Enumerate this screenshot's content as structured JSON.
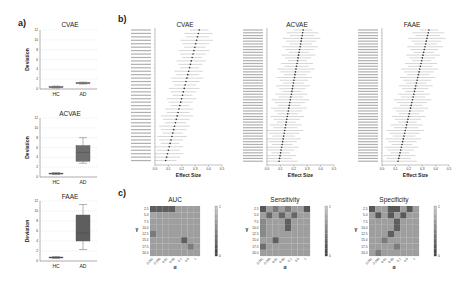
{
  "panels": {
    "a": "a)",
    "b": "b)",
    "c": "c)"
  },
  "chart_data": [
    {
      "id": "a-cvae",
      "type": "box",
      "title": "CVAE",
      "ylabel": "Deviation",
      "categories": [
        "HC",
        "AD"
      ],
      "ylim": [
        0,
        12
      ],
      "yticks": [
        0,
        2,
        4,
        6,
        8,
        10,
        12
      ],
      "boxes": [
        {
          "name": "HC",
          "min": 0.2,
          "q1": 0.3,
          "median": 0.4,
          "q3": 0.5,
          "max": 0.6
        },
        {
          "name": "AD",
          "min": 1.0,
          "q1": 1.1,
          "median": 1.2,
          "q3": 1.3,
          "max": 1.4
        }
      ],
      "grid": true,
      "color": "#7a7a7a"
    },
    {
      "id": "a-acvae",
      "type": "box",
      "title": "ACVAE",
      "ylabel": "Deviation",
      "categories": [
        "HC",
        "AD"
      ],
      "ylim": [
        0,
        12
      ],
      "yticks": [
        0,
        2,
        4,
        6,
        8,
        10,
        12
      ],
      "boxes": [
        {
          "name": "HC",
          "min": 0.5,
          "q1": 0.6,
          "median": 0.7,
          "q3": 0.8,
          "max": 0.9
        },
        {
          "name": "AD",
          "min": 2.8,
          "q1": 3.2,
          "median": 5.0,
          "q3": 6.4,
          "max": 8.0
        }
      ],
      "grid": true,
      "color": "#6e6e6e"
    },
    {
      "id": "a-faae",
      "type": "box",
      "title": "FAAE",
      "ylabel": "Deviation",
      "categories": [
        "HC",
        "AD"
      ],
      "ylim": [
        0,
        12
      ],
      "yticks": [
        0,
        2,
        4,
        6,
        8,
        10,
        12
      ],
      "boxes": [
        {
          "name": "HC",
          "min": 0.5,
          "q1": 0.6,
          "median": 0.7,
          "q3": 0.8,
          "max": 0.9
        },
        {
          "name": "AD",
          "min": 2.3,
          "q1": 4.0,
          "median": 5.6,
          "q3": 9.2,
          "max": 11.3
        }
      ],
      "grid": true,
      "color": "#5e5e5e"
    },
    {
      "id": "b-cvae",
      "type": "forest",
      "title": "CVAE",
      "xlabel": "Effect Size",
      "xlim": [
        0,
        0.5
      ],
      "xticks": [
        "0.0",
        "0.1",
        "0.2",
        "0.3",
        "0.4",
        "0.5"
      ],
      "n_rows": 39,
      "effect_range": [
        0.08,
        0.33
      ],
      "ci_halfwidth": [
        0.07,
        0.12
      ]
    },
    {
      "id": "b-acvae",
      "type": "forest",
      "title": "ACVAE",
      "xlabel": "Effect Size",
      "xlim": [
        0,
        0.5
      ],
      "xticks": [
        "0.0",
        "0.1",
        "0.2",
        "0.3",
        "0.4",
        "0.5"
      ],
      "n_rows": 48,
      "effect_range": [
        0.09,
        0.27
      ],
      "ci_halfwidth": [
        0.07,
        0.14
      ]
    },
    {
      "id": "b-faae",
      "type": "forest",
      "title": "FAAE",
      "xlabel": "Effect Size",
      "xlim": [
        0,
        0.5
      ],
      "xticks": [
        "0.0",
        "0.1",
        "0.2",
        "0.3",
        "0.4",
        "0.5"
      ],
      "n_rows": 48,
      "effect_range": [
        0.12,
        0.35
      ],
      "ci_halfwidth": [
        0.07,
        0.14
      ]
    },
    {
      "id": "c-auc",
      "type": "heatmap",
      "title": "AUC",
      "xlabel": "α",
      "ylabel": "γ",
      "yticks": [
        "2.5",
        "5.0",
        "7.5",
        "10.0",
        "12.5",
        "15.0",
        "17.5",
        "20.0"
      ],
      "xticks": [
        "0.001",
        "0.005",
        "0.01",
        "0.05",
        "0.1",
        "0.5",
        "1"
      ],
      "colorbar": {
        "min": 0,
        "max": 1
      },
      "values": [
        [
          0.25,
          0.25,
          0.25,
          0.25,
          0.7,
          0.7,
          0.7,
          0.7
        ],
        [
          0.75,
          0.7,
          0.7,
          0.7,
          0.7,
          0.7,
          0.7,
          0.7
        ],
        [
          0.7,
          0.7,
          0.7,
          0.7,
          0.7,
          0.7,
          0.7,
          0.7
        ],
        [
          0.7,
          0.7,
          0.7,
          0.7,
          0.7,
          0.7,
          0.7,
          0.7
        ],
        [
          0.45,
          0.7,
          0.7,
          0.7,
          0.7,
          0.7,
          0.7,
          0.7
        ],
        [
          0.7,
          0.7,
          0.7,
          0.7,
          0.7,
          0.25,
          0.7,
          0.7
        ],
        [
          0.7,
          0.7,
          0.7,
          0.7,
          0.7,
          0.7,
          0.45,
          0.7
        ],
        [
          0.7,
          0.7,
          0.7,
          0.7,
          0.7,
          0.7,
          0.7,
          0.7
        ]
      ]
    },
    {
      "id": "c-sensitivity",
      "type": "heatmap",
      "title": "Sensitivity",
      "xlabel": "α",
      "ylabel": "γ",
      "yticks": [
        "2.5",
        "5.0",
        "7.5",
        "10.0",
        "12.5",
        "15.0",
        "17.5",
        "20.0"
      ],
      "xticks": [
        "0.001",
        "0.005",
        "0.01",
        "0.05",
        "0.1",
        "0.5",
        "1"
      ],
      "colorbar": {
        "min": 0,
        "max": 1
      },
      "values": [
        [
          0.2,
          0.7,
          0.45,
          0.7,
          0.45,
          0.7,
          0.7,
          0.2
        ],
        [
          0.7,
          0.3,
          0.7,
          0.3,
          0.7,
          0.3,
          0.7,
          0.7
        ],
        [
          0.55,
          0.7,
          0.7,
          0.7,
          0.25,
          0.7,
          0.7,
          0.7
        ],
        [
          0.55,
          0.7,
          0.7,
          0.7,
          0.25,
          0.7,
          0.7,
          0.7
        ],
        [
          0.55,
          0.7,
          0.7,
          0.7,
          0.7,
          0.7,
          0.7,
          0.7
        ],
        [
          0.7,
          0.7,
          0.25,
          0.7,
          0.7,
          0.7,
          0.7,
          0.7
        ],
        [
          0.35,
          0.7,
          0.7,
          0.7,
          0.7,
          0.7,
          0.7,
          0.7
        ],
        [
          0.7,
          0.7,
          0.7,
          0.7,
          0.7,
          0.7,
          0.7,
          0.7
        ]
      ]
    },
    {
      "id": "c-specificity",
      "type": "heatmap",
      "title": "Specificity",
      "xlabel": "α",
      "ylabel": "γ",
      "yticks": [
        "2.5",
        "5.0",
        "7.5",
        "10.0",
        "12.5",
        "15.0",
        "17.5",
        "20.0"
      ],
      "xticks": [
        "0.001",
        "0.005",
        "0.01",
        "0.05",
        "0.1",
        "0.5",
        "1"
      ],
      "colorbar": {
        "min": 0,
        "max": 1
      },
      "values": [
        [
          0.2,
          0.7,
          0.7,
          0.2,
          0.2,
          0.7,
          0.2,
          0.7
        ],
        [
          0.7,
          0.2,
          0.7,
          0.2,
          0.7,
          0.2,
          0.7,
          0.7
        ],
        [
          0.7,
          0.7,
          0.7,
          0.7,
          0.25,
          0.7,
          0.7,
          0.7
        ],
        [
          0.7,
          0.7,
          0.7,
          0.7,
          0.25,
          0.7,
          0.7,
          0.7
        ],
        [
          0.7,
          0.7,
          0.7,
          0.25,
          0.7,
          0.7,
          0.7,
          0.7
        ],
        [
          0.7,
          0.7,
          0.45,
          0.7,
          0.7,
          0.7,
          0.7,
          0.7
        ],
        [
          0.7,
          0.7,
          0.7,
          0.7,
          0.45,
          0.7,
          0.7,
          0.7
        ],
        [
          0.7,
          0.45,
          0.7,
          0.7,
          0.7,
          0.7,
          0.7,
          0.7
        ]
      ]
    }
  ]
}
